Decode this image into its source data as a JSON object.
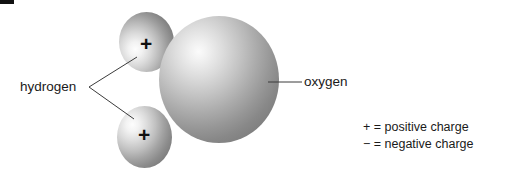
{
  "figure": {
    "background_color": "#ffffff",
    "ink_color": "#1a1a1a"
  },
  "atoms": [
    {
      "id": "oxygen",
      "element_name": "oxygen",
      "charge_symbol": "−",
      "charge_name": "negative",
      "label": "oxygen",
      "sphere_color_light": "#fbfbfb",
      "sphere_color_dark": "#808080"
    },
    {
      "id": "hydrogen-top",
      "element_name": "hydrogen",
      "charge_symbol": "+",
      "charge_name": "positive",
      "label": "hydrogen",
      "sphere_color_light": "#fdfdfd",
      "sphere_color_dark": "#727272"
    },
    {
      "id": "hydrogen-bottom",
      "element_name": "hydrogen",
      "charge_symbol": "+",
      "charge_name": "positive",
      "label": "hydrogen",
      "sphere_color_light": "#fdfdfd",
      "sphere_color_dark": "#767676"
    }
  ],
  "labels": {
    "hydrogen": "hydrogen",
    "oxygen": "oxygen"
  },
  "charges": {
    "plus_top": "+",
    "plus_bottom": "+",
    "minus_oxygen": "−"
  },
  "legend": {
    "lines": [
      "+ = positive charge",
      "− = negative charge"
    ],
    "line_1": "+ = positive charge",
    "line_2": "− = negative charge"
  }
}
